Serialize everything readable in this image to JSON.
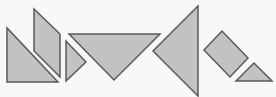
{
  "diagram": {
    "type": "tangram-pieces",
    "background": "#f8f8f8",
    "fill": "#c2c2c2",
    "stroke": "#5a5a5a",
    "stroke_width": 1.5,
    "pieces": [
      {
        "name": "large-right-triangle-left",
        "shape": "triangle",
        "points": "7,28 7,82 58,82"
      },
      {
        "name": "parallelogram",
        "shape": "parallelogram",
        "points": "34,9 60,34 60,77 34,51"
      },
      {
        "name": "small-triangle-pointing-right",
        "shape": "triangle",
        "points": "66,41 66,81 86,62"
      },
      {
        "name": "large-triangle-pointing-down",
        "shape": "triangle",
        "points": "69,34 160,34 114,80"
      },
      {
        "name": "large-triangle-pointing-left",
        "shape": "triangle",
        "points": "198,6 198,96 153,51"
      },
      {
        "name": "square",
        "shape": "square",
        "points": "204,50 222,31 248,58 230,77"
      },
      {
        "name": "small-triangle-pointing-up",
        "shape": "triangle",
        "points": "236,81 254,63 272,81"
      }
    ]
  }
}
